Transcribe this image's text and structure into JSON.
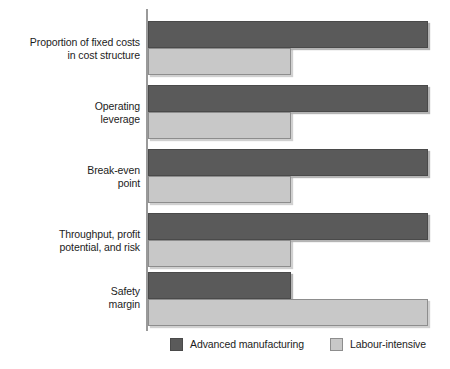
{
  "chart_data": {
    "type": "bar",
    "orientation": "horizontal",
    "title": "",
    "subtitle": "",
    "xlabel": "",
    "ylabel": "",
    "xlim": [
      0,
      100
    ],
    "grid": false,
    "legend_position": "bottom",
    "categories": [
      "Proportion of fixed costs in cost structure",
      "Operating leverage",
      "Break-even point",
      "Throughput, profit potential, and risk",
      "Safety margin"
    ],
    "category_lines": [
      [
        "Proportion of fixed costs",
        "in cost structure"
      ],
      [
        "Operating",
        "leverage"
      ],
      [
        "Break-even",
        "point"
      ],
      [
        "Throughput, profit",
        "potential, and risk"
      ],
      [
        "Safety",
        "margin"
      ]
    ],
    "series": [
      {
        "name": "Advanced manufacturing",
        "color": "#5a5a5a",
        "values": [
          100,
          100,
          100,
          100,
          51
        ]
      },
      {
        "name": "Labour-intensive",
        "color": "#c8c8c8",
        "values": [
          51,
          51,
          51,
          51,
          100
        ]
      }
    ],
    "tick_labels": [],
    "annotations": []
  },
  "legend": {
    "items": [
      {
        "label": "Advanced manufacturing",
        "swatch": "dark"
      },
      {
        "label": "Labour-intensive",
        "swatch": "light"
      }
    ]
  }
}
